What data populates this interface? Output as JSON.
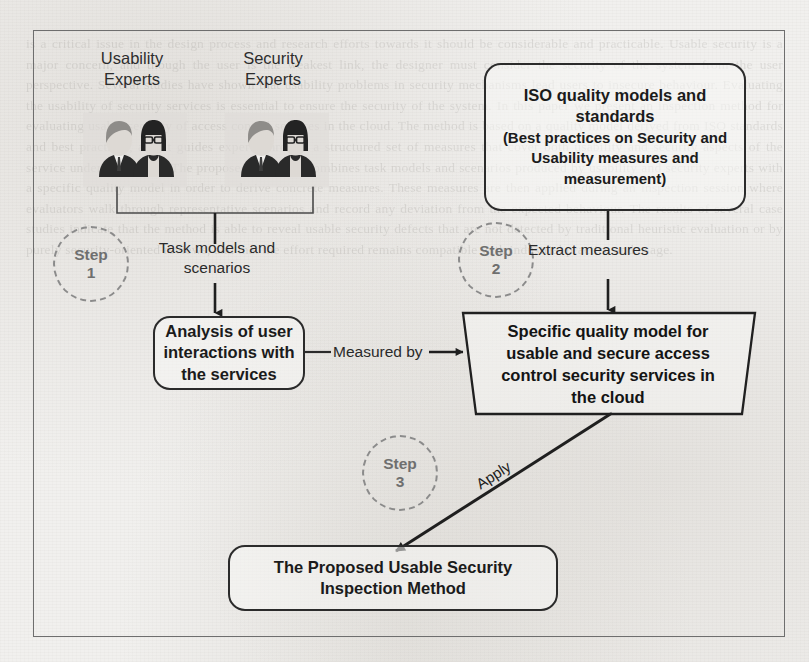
{
  "page": {
    "width": 809,
    "height": 662,
    "background_color": "#f1f0ee",
    "frame_color": "#6e6e6e",
    "ghost_text": "is a critical issue in the design process and research efforts towards it should be considerable and practicable. Usable security is a major concern, and though the user is the weakest link, the designer must consider the security of the system from the user perspective. Several studies have shown that usability problems in security mechanisms lead users to insecure behaviour. Evaluating the usability of security services is essential to ensure the security of the system. In this paper we present an inspection method for evaluating usable security of access control services in the cloud. The method is based on a quality model derived from ISO standards and best practices, and it guides experts through a structured set of measures that cover both usability and security aspects of the service under evaluation. The proposed approach combines task models and scenarios produced by usability and security experts with a specific quality model in order to derive concrete measures. These measures are then applied during an inspection session where evaluators walk through representative scenarios and record any deviation from the expected behaviour. The results of several case studies indicate that the method is able to reveal usable security defects that are not detected by traditional heuristic evaluation or by purely security-oriented reviews, and that the effort required remains compatible with industrial practice and usage."
  },
  "diagram": {
    "actors": [
      {
        "id": "usability-experts",
        "label": "Usability\nExperts",
        "label_line1": "Usability",
        "label_line2": "Experts"
      },
      {
        "id": "security-experts",
        "label": "Security\nExperts",
        "label_line1": "Security",
        "label_line2": "Experts"
      }
    ],
    "steps": [
      {
        "id": "step-1",
        "word": "Step",
        "number": "1"
      },
      {
        "id": "step-2",
        "word": "Step",
        "number": "2"
      },
      {
        "id": "step-3",
        "word": "Step",
        "number": "3"
      }
    ],
    "nodes": {
      "iso": {
        "id": "iso-quality-models",
        "title_line1": "ISO quality models and",
        "title_line2": "standards",
        "sub_line1": "(Best practices on Security and",
        "sub_line2": "Usability measures and",
        "sub_line3": "measurement)",
        "shape": "rounded-rectangle"
      },
      "analysis": {
        "id": "analysis-of-user-interactions",
        "line1": "Analysis of user",
        "line2": "interactions with",
        "line3": "the services",
        "shape": "rounded-rectangle"
      },
      "quality_model": {
        "id": "specific-quality-model",
        "line1": "Specific quality model for",
        "line2": "usable and secure access",
        "line3": "control security services in",
        "line4": "the cloud",
        "shape": "trapezoid"
      },
      "proposed_method": {
        "id": "proposed-usable-security-inspection-method",
        "line1": "The Proposed Usable Security",
        "line2": "Inspection Method",
        "shape": "rounded-rectangle"
      }
    },
    "edge_labels": {
      "task_models_line1": "Task models and",
      "task_models_line2": "scenarios",
      "extract_measures": "Extract measures",
      "measured_by": "Measured by",
      "apply": "Apply"
    }
  }
}
